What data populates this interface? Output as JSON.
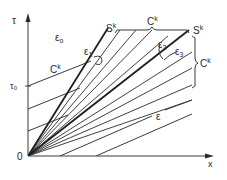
{
  "figure": {
    "axes": {
      "y_label": "τ",
      "x_label": "x",
      "origin_label": "0",
      "tick_label": "τ₀"
    },
    "labels": {
      "eps0": "ε",
      "eps0_sub": "o",
      "eps1": "ε",
      "eps1_sub": "1",
      "eps2": "ε",
      "eps2_sub": "2",
      "eps3": "ε",
      "eps3_sub": "3",
      "eps": "ε",
      "ck_left": "C",
      "ck_top": "C",
      "ck_right": "C",
      "ck_sup": "k",
      "sk_left": "S",
      "sk_right": "S",
      "sk_sup": "k"
    }
  }
}
